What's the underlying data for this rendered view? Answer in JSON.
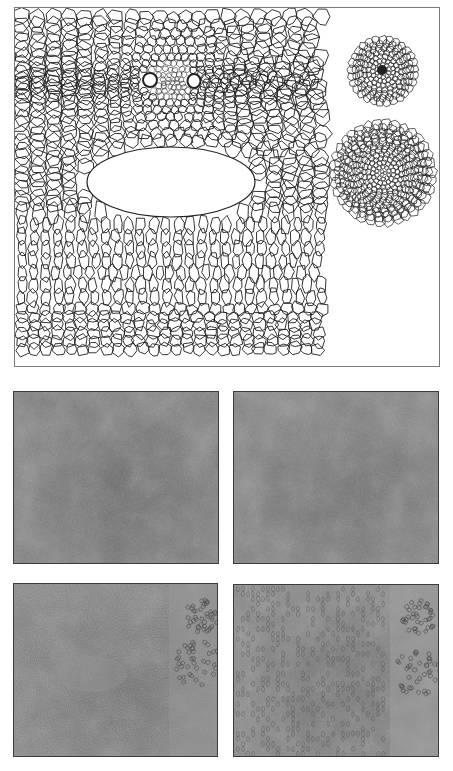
{
  "figure": {
    "top": {
      "label": "synthesized cellular texture (exemplar)",
      "frame": {
        "x": 14,
        "y": 7,
        "w": 426,
        "h": 360
      },
      "cell_area": {
        "x": 17,
        "y": 12,
        "w": 307,
        "h": 344
      },
      "holes": [
        {
          "name": "left-eye",
          "cx": 149,
          "cy": 79,
          "rx": 7,
          "ry": 7
        },
        {
          "name": "right-eye",
          "cx": 193,
          "cy": 80,
          "rx": 6.5,
          "ry": 7
        },
        {
          "name": "mouth",
          "cx": 170,
          "cy": 181,
          "rx": 84,
          "ry": 35
        }
      ],
      "discs": [
        {
          "name": "small-disc",
          "cx": 382,
          "cy": 70,
          "r": 35,
          "dark_core": true
        },
        {
          "name": "large-disc",
          "cx": 382,
          "cy": 172,
          "r": 52,
          "dark_core": false
        }
      ],
      "stroke_color": "#1e1e1e"
    },
    "panels": [
      {
        "name": "panel-top-left",
        "x": 13,
        "y": 391,
        "w": 206,
        "h": 173,
        "base": "#7e7e7e",
        "dark": "#5e5e5e",
        "light": "#9c9c9c",
        "seed": 3,
        "cells": false,
        "dense": false
      },
      {
        "name": "panel-top-right",
        "x": 233,
        "y": 391,
        "w": 206,
        "h": 173,
        "base": "#828282",
        "dark": "#626262",
        "light": "#a4a4a4",
        "seed": 7,
        "cells": false,
        "dense": false
      },
      {
        "name": "panel-bottom-left",
        "x": 13,
        "y": 583,
        "w": 205,
        "h": 174,
        "base": "#7a7a7a",
        "dark": "#5a5a5a",
        "light": "#969696",
        "seed": 11,
        "cells": true,
        "dense": true
      },
      {
        "name": "panel-bottom-right",
        "x": 233,
        "y": 584,
        "w": 206,
        "h": 173,
        "base": "#858585",
        "dark": "#646464",
        "light": "#a2a2a2",
        "seed": 17,
        "cells": true,
        "dense": false
      }
    ]
  }
}
